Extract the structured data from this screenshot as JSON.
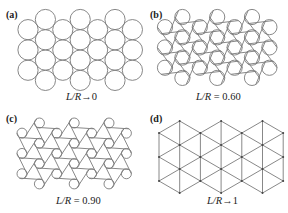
{
  "figure": {
    "panels": [
      {
        "id": "a",
        "label": "(a)",
        "caption_var": "L/R",
        "caption_rel": "→",
        "caption_val": "0",
        "kind": "circles",
        "ratio": 0
      },
      {
        "id": "b",
        "label": "(b)",
        "caption_var": "L/R",
        "caption_rel": " = ",
        "caption_val": "0.60",
        "kind": "circles-tangent",
        "ratio": 0.6
      },
      {
        "id": "c",
        "label": "(c)",
        "caption_var": "L/R",
        "caption_rel": " = ",
        "caption_val": "0.90",
        "kind": "circles-tangent",
        "ratio": 0.9
      },
      {
        "id": "d",
        "label": "(d)",
        "caption_var": "L/R",
        "caption_rel": "→",
        "caption_val": "1",
        "kind": "lattice",
        "ratio": 1
      }
    ],
    "line_color": "#7a7a7a"
  }
}
